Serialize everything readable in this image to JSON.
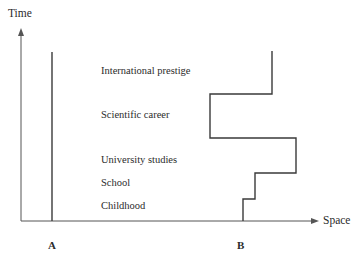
{
  "diagram": {
    "title_text_visible": false,
    "axes": {
      "y_label": "Time",
      "x_label": "Space",
      "y_axis_color": "#555555",
      "x_axis_color": "#555555"
    },
    "observers": [
      {
        "id": "A",
        "tick_label": "A",
        "worldline_type": "straight-vertical"
      },
      {
        "id": "B",
        "tick_label": "B",
        "worldline_type": "staircase"
      }
    ],
    "stages": [
      {
        "key": "childhood",
        "label": "Childhood"
      },
      {
        "key": "school",
        "label": "School"
      },
      {
        "key": "university",
        "label": "University studies"
      },
      {
        "key": "scientific",
        "label": "Scientific career"
      },
      {
        "key": "international",
        "label": "International prestige"
      }
    ],
    "colors": {
      "line": "#3a3a3a",
      "axis": "#555555",
      "text": "#2b2b2b",
      "background": "#ffffff"
    }
  },
  "chart_data": {
    "type": "line",
    "title": "",
    "xlabel": "Space",
    "ylabel": "Time",
    "xlim": [
      0,
      363
    ],
    "ylim": [
      0,
      262
    ],
    "grid": false,
    "legend": null,
    "annotations": [
      {
        "text": "International prestige",
        "x": 101,
        "y": 66
      },
      {
        "text": "Scientific career",
        "x": 101,
        "y": 110
      },
      {
        "text": "University studies",
        "x": 101,
        "y": 155
      },
      {
        "text": "School",
        "x": 101,
        "y": 178
      },
      {
        "text": "Childhood",
        "x": 101,
        "y": 201
      },
      {
        "text": "A",
        "x": 48,
        "y": 240
      },
      {
        "text": "B",
        "x": 237,
        "y": 240
      }
    ],
    "series": [
      {
        "name": "A",
        "points": [
          [
            52,
            221
          ],
          [
            52,
            52
          ]
        ]
      },
      {
        "name": "B",
        "points": [
          [
            243,
            221
          ],
          [
            243,
            199
          ],
          [
            255,
            199
          ],
          [
            255,
            173
          ],
          [
            296,
            173
          ],
          [
            296,
            138
          ],
          [
            210,
            138
          ],
          [
            210,
            94
          ],
          [
            272,
            94
          ],
          [
            272,
            51
          ]
        ]
      }
    ]
  }
}
